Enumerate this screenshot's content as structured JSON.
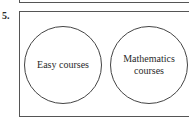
{
  "question": {
    "number": "5."
  },
  "venn": {
    "sets": [
      {
        "label": "Easy courses"
      },
      {
        "label": "Mathematics courses"
      }
    ]
  }
}
